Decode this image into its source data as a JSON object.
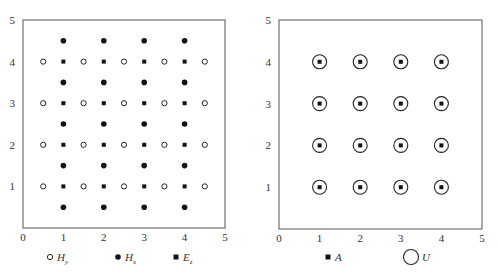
{
  "panels": [
    {
      "id": "left",
      "x_ticks": [
        "0",
        "1",
        "2",
        "3",
        "4",
        "5"
      ],
      "y_ticks": [
        "1",
        "2",
        "3",
        "4",
        "5"
      ],
      "range": [
        0,
        5
      ],
      "series": [
        {
          "name": "Hy",
          "marker": "open-circle",
          "points": [
            [
              0.5,
              1
            ],
            [
              1.5,
              1
            ],
            [
              2.5,
              1
            ],
            [
              3.5,
              1
            ],
            [
              4.5,
              1
            ],
            [
              0.5,
              2
            ],
            [
              1.5,
              2
            ],
            [
              2.5,
              2
            ],
            [
              3.5,
              2
            ],
            [
              4.5,
              2
            ],
            [
              0.5,
              3
            ],
            [
              1.5,
              3
            ],
            [
              2.5,
              3
            ],
            [
              3.5,
              3
            ],
            [
              4.5,
              3
            ],
            [
              0.5,
              4
            ],
            [
              1.5,
              4
            ],
            [
              2.5,
              4
            ],
            [
              3.5,
              4
            ],
            [
              4.5,
              4
            ]
          ]
        },
        {
          "name": "Hx",
          "marker": "filled-circle",
          "points": [
            [
              1,
              0.5
            ],
            [
              2,
              0.5
            ],
            [
              3,
              0.5
            ],
            [
              4,
              0.5
            ],
            [
              1,
              1.5
            ],
            [
              2,
              1.5
            ],
            [
              3,
              1.5
            ],
            [
              4,
              1.5
            ],
            [
              1,
              2.5
            ],
            [
              2,
              2.5
            ],
            [
              3,
              2.5
            ],
            [
              4,
              2.5
            ],
            [
              1,
              3.5
            ],
            [
              2,
              3.5
            ],
            [
              3,
              3.5
            ],
            [
              4,
              3.5
            ],
            [
              1,
              4.5
            ],
            [
              2,
              4.5
            ],
            [
              3,
              4.5
            ],
            [
              4,
              4.5
            ]
          ]
        },
        {
          "name": "Ez",
          "marker": "filled-square",
          "points": [
            [
              1,
              1
            ],
            [
              2,
              1
            ],
            [
              3,
              1
            ],
            [
              4,
              1
            ],
            [
              1,
              2
            ],
            [
              2,
              2
            ],
            [
              3,
              2
            ],
            [
              4,
              2
            ],
            [
              1,
              3
            ],
            [
              2,
              3
            ],
            [
              3,
              3
            ],
            [
              4,
              3
            ],
            [
              1,
              4
            ],
            [
              2,
              4
            ],
            [
              3,
              4
            ],
            [
              4,
              4
            ]
          ]
        }
      ],
      "legend": [
        {
          "marker": "open-circle",
          "main": "H",
          "sub": "y"
        },
        {
          "marker": "filled-circle",
          "main": "H",
          "sub": "x"
        },
        {
          "marker": "filled-square",
          "main": "E",
          "sub": "z"
        }
      ]
    },
    {
      "id": "right",
      "x_ticks": [
        "0",
        "1",
        "2",
        "3",
        "4",
        "5"
      ],
      "y_ticks": [
        "1",
        "2",
        "3",
        "4",
        "5"
      ],
      "range": [
        0,
        5
      ],
      "series": [
        {
          "name": "A",
          "marker": "filled-square",
          "points": [
            [
              1,
              1
            ],
            [
              2,
              1
            ],
            [
              3,
              1
            ],
            [
              4,
              1
            ],
            [
              1,
              2
            ],
            [
              2,
              2
            ],
            [
              3,
              2
            ],
            [
              4,
              2
            ],
            [
              1,
              3
            ],
            [
              2,
              3
            ],
            [
              3,
              3
            ],
            [
              4,
              3
            ],
            [
              1,
              4
            ],
            [
              2,
              4
            ],
            [
              3,
              4
            ],
            [
              4,
              4
            ]
          ]
        },
        {
          "name": "U",
          "marker": "ring",
          "points": [
            [
              1,
              1
            ],
            [
              2,
              1
            ],
            [
              3,
              1
            ],
            [
              4,
              1
            ],
            [
              1,
              2
            ],
            [
              2,
              2
            ],
            [
              3,
              2
            ],
            [
              4,
              2
            ],
            [
              1,
              3
            ],
            [
              2,
              3
            ],
            [
              3,
              3
            ],
            [
              4,
              3
            ],
            [
              1,
              4
            ],
            [
              2,
              4
            ],
            [
              3,
              4
            ],
            [
              4,
              4
            ]
          ]
        }
      ],
      "legend": [
        {
          "marker": "filled-square",
          "main": "A",
          "sub": ""
        },
        {
          "marker": "ring",
          "main": "U",
          "sub": ""
        }
      ]
    }
  ]
}
